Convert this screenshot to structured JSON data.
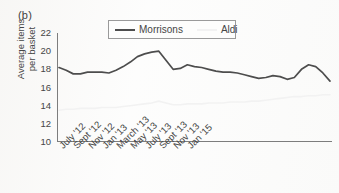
{
  "panel": {
    "label": "(b)"
  },
  "legend": {
    "position": "top-center",
    "entries": [
      {
        "label": "Morrisons",
        "color": "#4d4d4d",
        "icon": "line-swatch"
      },
      {
        "label": "Aldi",
        "color": "#f2f2f2",
        "icon": "line-swatch"
      }
    ]
  },
  "chart_data": {
    "type": "line",
    "title": "",
    "subtitle": "",
    "xlabel": "",
    "ylabel": "Average items per basket",
    "ylabel_lines": [
      "Average items",
      "per basket"
    ],
    "ylim": [
      10,
      22
    ],
    "yticks": [
      10,
      12,
      14,
      16,
      18,
      20,
      22
    ],
    "ytick_labels": [
      "10",
      "12",
      "14",
      "16",
      "18",
      "20",
      "22"
    ],
    "grid": false,
    "legend_position": "top-center",
    "xticks": [
      0,
      2,
      4,
      6,
      8,
      10,
      12,
      14,
      16,
      18
    ],
    "xtick_labels": [
      "July '12",
      "Sept '12",
      "Nov '12",
      "Jan '13",
      "March '13",
      "May '13",
      "July '13",
      "Sept '13",
      "Nov '13",
      "Jan '15"
    ],
    "x": [
      0,
      1,
      2,
      3,
      4,
      5,
      6,
      7,
      8,
      9,
      10,
      11,
      12,
      13,
      14,
      15,
      16,
      17,
      18,
      19,
      20,
      21,
      22,
      23,
      24,
      25,
      26,
      27,
      28,
      29,
      30,
      31,
      32,
      33
    ],
    "series": [
      {
        "name": "Morrisons",
        "color": "#4d4d4d",
        "values": [
          18.2,
          17.9,
          17.5,
          17.5,
          17.7,
          17.7,
          17.7,
          17.6,
          17.9,
          18.3,
          18.8,
          19.4,
          19.7,
          19.9,
          20.0,
          19.0,
          18.0,
          18.1,
          18.5,
          18.3,
          18.2,
          18.0,
          17.8,
          17.7,
          17.7,
          17.6,
          17.4,
          17.2,
          17.0,
          17.1,
          17.3,
          17.2,
          16.9,
          17.1
        ]
      },
      {
        "name": "Aldi",
        "color": "#f2f2f2",
        "values": [
          13.5,
          13.6,
          13.6,
          13.7,
          13.7,
          13.7,
          13.8,
          13.8,
          13.8,
          13.9,
          14.0,
          14.1,
          14.2,
          14.3,
          14.5,
          14.3,
          14.1,
          14.1,
          14.2,
          14.2,
          14.2,
          14.3,
          14.3,
          14.3,
          14.4,
          14.4,
          14.4,
          14.5,
          14.5,
          14.6,
          14.7,
          14.8,
          14.9,
          15.0
        ]
      }
    ],
    "series_tail": {
      "Morrisons": [
        18.0,
        18.5,
        18.3,
        17.6,
        16.7
      ],
      "Aldi": [
        15.0,
        15.1,
        15.1,
        15.2,
        15.2
      ]
    }
  }
}
